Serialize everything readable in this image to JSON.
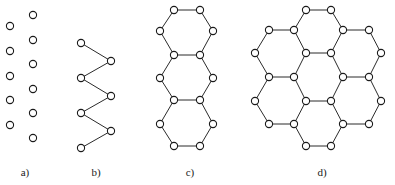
{
  "figure": {
    "width": 395,
    "height": 185,
    "background_color": "#ffffff",
    "node_color": "#ffffff",
    "node_stroke_color": "#1a1a1a",
    "edge_color": "#2b2b2b",
    "node_radius": 3.6
  },
  "panels": [
    {
      "id": "panel-a",
      "label": "a)",
      "label_x": 25,
      "label_y": 176,
      "description": "two staggered columns of isolated vertices, no edges",
      "nodes": [
        {
          "x": 33,
          "y": 15
        },
        {
          "x": 10,
          "y": 26
        },
        {
          "x": 33,
          "y": 40
        },
        {
          "x": 10,
          "y": 51
        },
        {
          "x": 33,
          "y": 64
        },
        {
          "x": 10,
          "y": 76
        },
        {
          "x": 33,
          "y": 89
        },
        {
          "x": 10,
          "y": 100
        },
        {
          "x": 33,
          "y": 113
        },
        {
          "x": 10,
          "y": 125
        },
        {
          "x": 33,
          "y": 138
        }
      ],
      "edges": []
    },
    {
      "id": "panel-b",
      "label": "b)",
      "label_x": 96,
      "label_y": 176,
      "description": "zigzag polyene chain of seven vertices",
      "nodes": [
        {
          "x": 81,
          "y": 43
        },
        {
          "x": 111,
          "y": 61
        },
        {
          "x": 81,
          "y": 78
        },
        {
          "x": 111,
          "y": 96
        },
        {
          "x": 81,
          "y": 113
        },
        {
          "x": 111,
          "y": 131
        },
        {
          "x": 81,
          "y": 148
        }
      ],
      "edges": [
        [
          0,
          1
        ],
        [
          1,
          2
        ],
        [
          2,
          3
        ],
        [
          3,
          4
        ],
        [
          4,
          5
        ],
        [
          5,
          6
        ]
      ]
    },
    {
      "id": "panel-c",
      "label": "c)",
      "label_x": 190,
      "label_y": 176,
      "description": "linear chain of three fused hexagons (anthracene-like)",
      "nodes": [
        {
          "x": 174,
          "y": 10
        },
        {
          "x": 200,
          "y": 10
        },
        {
          "x": 160,
          "y": 31
        },
        {
          "x": 213,
          "y": 31
        },
        {
          "x": 174,
          "y": 55
        },
        {
          "x": 200,
          "y": 55
        },
        {
          "x": 160,
          "y": 78
        },
        {
          "x": 213,
          "y": 78
        },
        {
          "x": 174,
          "y": 100
        },
        {
          "x": 200,
          "y": 100
        },
        {
          "x": 160,
          "y": 124
        },
        {
          "x": 213,
          "y": 124
        },
        {
          "x": 174,
          "y": 146
        },
        {
          "x": 200,
          "y": 146
        }
      ],
      "edges": [
        [
          0,
          1
        ],
        [
          0,
          2
        ],
        [
          1,
          3
        ],
        [
          2,
          4
        ],
        [
          3,
          5
        ],
        [
          4,
          5
        ],
        [
          4,
          6
        ],
        [
          5,
          7
        ],
        [
          6,
          8
        ],
        [
          7,
          9
        ],
        [
          8,
          9
        ],
        [
          8,
          10
        ],
        [
          9,
          11
        ],
        [
          10,
          12
        ],
        [
          11,
          13
        ],
        [
          12,
          13
        ]
      ]
    },
    {
      "id": "panel-d",
      "label": "d)",
      "label_x": 322,
      "label_y": 176,
      "description": "honeycomb cluster of seven fused hexagons (coronene-like)",
      "nodes": [
        {
          "x": 306,
          "y": 10
        },
        {
          "x": 331,
          "y": 10
        },
        {
          "x": 269,
          "y": 30
        },
        {
          "x": 294,
          "y": 30
        },
        {
          "x": 343,
          "y": 30
        },
        {
          "x": 369,
          "y": 30
        },
        {
          "x": 255,
          "y": 53
        },
        {
          "x": 306,
          "y": 53
        },
        {
          "x": 331,
          "y": 53
        },
        {
          "x": 381,
          "y": 53
        },
        {
          "x": 269,
          "y": 77
        },
        {
          "x": 294,
          "y": 77
        },
        {
          "x": 343,
          "y": 77
        },
        {
          "x": 369,
          "y": 77
        },
        {
          "x": 255,
          "y": 101
        },
        {
          "x": 306,
          "y": 101
        },
        {
          "x": 331,
          "y": 101
        },
        {
          "x": 381,
          "y": 101
        },
        {
          "x": 269,
          "y": 124
        },
        {
          "x": 294,
          "y": 124
        },
        {
          "x": 343,
          "y": 124
        },
        {
          "x": 369,
          "y": 124
        },
        {
          "x": 306,
          "y": 146
        },
        {
          "x": 331,
          "y": 146
        }
      ],
      "edges": [
        [
          0,
          1
        ],
        [
          0,
          3
        ],
        [
          1,
          4
        ],
        [
          2,
          3
        ],
        [
          4,
          5
        ],
        [
          2,
          6
        ],
        [
          3,
          7
        ],
        [
          4,
          8
        ],
        [
          5,
          9
        ],
        [
          7,
          8
        ],
        [
          6,
          10
        ],
        [
          7,
          11
        ],
        [
          8,
          12
        ],
        [
          9,
          13
        ],
        [
          10,
          11
        ],
        [
          12,
          13
        ],
        [
          10,
          14
        ],
        [
          11,
          15
        ],
        [
          12,
          16
        ],
        [
          13,
          17
        ],
        [
          15,
          16
        ],
        [
          14,
          18
        ],
        [
          15,
          19
        ],
        [
          16,
          20
        ],
        [
          17,
          21
        ],
        [
          18,
          19
        ],
        [
          20,
          21
        ],
        [
          19,
          22
        ],
        [
          20,
          23
        ],
        [
          22,
          23
        ]
      ]
    }
  ]
}
